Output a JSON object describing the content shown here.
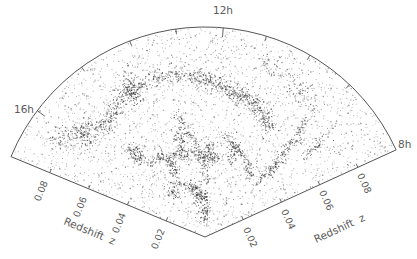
{
  "chart_data": {
    "type": "scatter",
    "subtype": "polar-wedge (galaxy redshift survey cone diagram)",
    "title": "",
    "apex": [
      205,
      237
    ],
    "radius_px": 210,
    "radial_axis": {
      "label": "Redshift z",
      "range": [
        0,
        0.1
      ],
      "ticks": [
        0.02,
        0.04,
        0.06,
        0.08
      ],
      "tick_labels": [
        "0.02",
        "0.04",
        "0.06",
        "0.08"
      ]
    },
    "angular_axis": {
      "label": "Right Ascension (hours)",
      "labeled_hours": [
        "16h",
        "12h",
        "8h"
      ],
      "hour_angles_deg": {
        "16h": 143,
        "12h": 85,
        "8h": 24.5
      },
      "wedge_range_deg": [
        24.5,
        157.5
      ],
      "minor_ticks_deg": [
        46.5,
        60,
        73,
        98,
        111,
        126
      ]
    },
    "grid": false,
    "legend": null,
    "point_color": "#3a3a3a",
    "structures": {
      "filaments": [
        {
          "name": "great-wall",
          "z": [
            0.072,
            0.078,
            0.08,
            0.078,
            0.074,
            0.07,
            0.066,
            0.06
          ],
          "ang": [
            132,
            120,
            108,
            96,
            86,
            76,
            67,
            58
          ],
          "density": 900,
          "width": 4.5
        },
        {
          "name": "left-wall",
          "z": [
            0.085,
            0.08,
            0.075,
            0.07
          ],
          "ang": [
            148,
            142,
            136,
            130
          ],
          "density": 200,
          "width": 5
        },
        {
          "name": "right-vertical",
          "z": [
            0.075,
            0.065,
            0.055,
            0.045,
            0.035
          ],
          "ang": [
            50,
            48,
            47,
            46,
            46
          ],
          "density": 220,
          "width": 2.5
        },
        {
          "name": "mid-web-1",
          "z": [
            0.045,
            0.042,
            0.04,
            0.038
          ],
          "ang": [
            125,
            110,
            95,
            80
          ],
          "density": 260,
          "width": 3
        },
        {
          "name": "mid-web-2",
          "z": [
            0.06,
            0.052,
            0.045,
            0.035,
            0.025
          ],
          "ang": [
            103,
            100,
            96,
            92,
            90
          ],
          "density": 160,
          "width": 2.5
        },
        {
          "name": "lower-web",
          "z": [
            0.03,
            0.026,
            0.022,
            0.018,
            0.012
          ],
          "ang": [
            120,
            108,
            98,
            90,
            88
          ],
          "density": 180,
          "width": 2.5
        },
        {
          "name": "right-mid",
          "z": [
            0.05,
            0.045,
            0.04,
            0.035
          ],
          "ang": [
            80,
            70,
            60,
            52
          ],
          "density": 150,
          "width": 2.5
        },
        {
          "name": "outer-right",
          "z": [
            0.09,
            0.085,
            0.08
          ],
          "ang": [
            72,
            60,
            48
          ],
          "density": 140,
          "width": 5
        }
      ],
      "clusters": [
        {
          "z": 0.052,
          "ang": 130,
          "n": 90,
          "r": 4
        },
        {
          "z": 0.036,
          "ang": 115,
          "n": 60,
          "r": 3.5
        },
        {
          "z": 0.048,
          "ang": 105,
          "n": 50,
          "r": 3.5
        },
        {
          "z": 0.04,
          "ang": 87,
          "n": 70,
          "r": 4
        },
        {
          "z": 0.043,
          "ang": 72,
          "n": 60,
          "r": 3.5
        },
        {
          "z": 0.026,
          "ang": 126,
          "n": 50,
          "r": 3.5
        },
        {
          "z": 0.02,
          "ang": 100,
          "n": 55,
          "r": 3
        },
        {
          "z": 0.075,
          "ang": 140,
          "n": 70,
          "r": 5
        },
        {
          "z": 0.079,
          "ang": 117,
          "n": 90,
          "r": 5
        },
        {
          "z": 0.068,
          "ang": 40,
          "n": 50,
          "r": 4
        },
        {
          "z": 0.01,
          "ang": 92,
          "n": 30,
          "r": 2.5
        }
      ],
      "background_points": 2600
    }
  },
  "labels": {
    "hour_top": "12h",
    "hour_left": "16h",
    "hour_right": "8h",
    "axis_left": "Redshift  z",
    "axis_right": "Redshift  z",
    "ticks_left": [
      "0.08",
      "0.06",
      "0.04",
      "0.02"
    ],
    "ticks_right": [
      "0.02",
      "0.04",
      "0.06",
      "0.08"
    ]
  }
}
